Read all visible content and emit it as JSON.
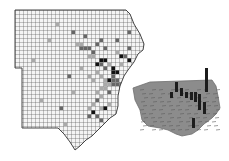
{
  "figure": {
    "width": 229,
    "height": 161,
    "background": "#ffffff",
    "grid_map": {
      "cell_size": 4,
      "origin": [
        15,
        10
      ],
      "outline": [
        [
          15,
          10
        ],
        [
          126,
          10
        ],
        [
          130,
          14
        ],
        [
          134,
          24
        ],
        [
          140,
          34
        ],
        [
          144,
          44
        ],
        [
          143,
          50
        ],
        [
          138,
          54
        ],
        [
          134,
          62
        ],
        [
          128,
          70
        ],
        [
          124,
          76
        ],
        [
          120,
          86
        ],
        [
          118,
          96
        ],
        [
          118,
          106
        ],
        [
          116,
          114
        ],
        [
          110,
          118
        ],
        [
          104,
          124
        ],
        [
          98,
          130
        ],
        [
          92,
          136
        ],
        [
          86,
          140
        ],
        [
          80,
          146
        ],
        [
          75,
          150
        ],
        [
          70,
          142
        ],
        [
          64,
          134
        ],
        [
          58,
          128
        ],
        [
          22,
          128
        ],
        [
          22,
          68
        ],
        [
          15,
          68
        ]
      ],
      "grid_color": "#5a5a5a",
      "fill_color": "#f4f4f4",
      "outline_color": "#444444",
      "dark_color": "#111111",
      "medium_color": "#666666",
      "light_color": "#a9a9a9",
      "cells_dark": [
        [
          21,
          12
        ],
        [
          22,
          12
        ],
        [
          20,
          13
        ],
        [
          24,
          15
        ],
        [
          23,
          17
        ],
        [
          25,
          15
        ],
        [
          27,
          19
        ],
        [
          26,
          20
        ],
        [
          27,
          20
        ],
        [
          28,
          20
        ],
        [
          28,
          21
        ],
        [
          27,
          21
        ],
        [
          29,
          22
        ],
        [
          29,
          19
        ],
        [
          26,
          19
        ],
        [
          24,
          14
        ],
        [
          26,
          23
        ],
        [
          19,
          25
        ],
        [
          22,
          24
        ],
        [
          31,
          15
        ],
        [
          18,
          33
        ],
        [
          28,
          12
        ],
        [
          26,
          11
        ]
      ],
      "cells_medium": [
        [
          14,
          5
        ],
        [
          17,
          6
        ],
        [
          20,
          8
        ],
        [
          21,
          7
        ],
        [
          25,
          7
        ],
        [
          28,
          5
        ],
        [
          22,
          9
        ],
        [
          16,
          9
        ],
        [
          17,
          9
        ],
        [
          18,
          9
        ],
        [
          19,
          10
        ],
        [
          21,
          13
        ],
        [
          22,
          14
        ],
        [
          24,
          16
        ],
        [
          25,
          17
        ],
        [
          25,
          18
        ],
        [
          24,
          18
        ],
        [
          26,
          18
        ],
        [
          23,
          20
        ],
        [
          20,
          22
        ],
        [
          18,
          26
        ],
        [
          20,
          26
        ],
        [
          21,
          27
        ],
        [
          24,
          17
        ],
        [
          27,
          11
        ],
        [
          13,
          16
        ],
        [
          11,
          24
        ],
        [
          28,
          9
        ]
      ],
      "cells_light": [
        [
          10,
          3
        ],
        [
          15,
          8
        ],
        [
          16,
          8
        ],
        [
          18,
          11
        ],
        [
          19,
          11
        ],
        [
          20,
          15
        ],
        [
          21,
          16
        ],
        [
          22,
          17
        ],
        [
          22,
          18
        ],
        [
          23,
          18
        ],
        [
          21,
          19
        ],
        [
          22,
          19
        ],
        [
          20,
          20
        ],
        [
          21,
          21
        ],
        [
          19,
          17
        ],
        [
          18,
          16
        ],
        [
          16,
          14
        ],
        [
          14,
          20
        ],
        [
          12,
          28
        ],
        [
          9,
          30
        ],
        [
          6,
          22
        ],
        [
          4,
          12
        ],
        [
          8,
          7
        ],
        [
          25,
          10
        ],
        [
          26,
          13
        ],
        [
          23,
          13
        ],
        [
          19,
          23
        ],
        [
          18,
          24
        ],
        [
          21,
          24
        ],
        [
          23,
          23
        ]
      ]
    },
    "perspective_view": {
      "outline": [
        [
          133,
          88
        ],
        [
          150,
          82
        ],
        [
          212,
          80
        ],
        [
          216,
          86
        ],
        [
          218,
          96
        ],
        [
          220,
          108
        ],
        [
          216,
          114
        ],
        [
          212,
          118
        ],
        [
          204,
          124
        ],
        [
          198,
          130
        ],
        [
          192,
          134
        ],
        [
          182,
          136
        ],
        [
          176,
          134
        ],
        [
          168,
          130
        ],
        [
          160,
          128
        ],
        [
          148,
          126
        ],
        [
          142,
          120
        ],
        [
          140,
          110
        ],
        [
          135,
          100
        ]
      ],
      "fill_color": "#8c8c8c",
      "edge_color": "#6e6e6e",
      "bars": [
        {
          "x": 175,
          "y": 90,
          "h": 8
        },
        {
          "x": 180,
          "y": 94,
          "h": 6
        },
        {
          "x": 185,
          "y": 96,
          "h": 4
        },
        {
          "x": 190,
          "y": 98,
          "h": 6
        },
        {
          "x": 194,
          "y": 100,
          "h": 8
        },
        {
          "x": 205,
          "y": 90,
          "h": 22
        },
        {
          "x": 198,
          "y": 108,
          "h": 14
        },
        {
          "x": 203,
          "y": 112,
          "h": 10
        },
        {
          "x": 192,
          "y": 126,
          "h": 8
        },
        {
          "x": 170,
          "y": 96,
          "h": 4
        }
      ],
      "bar_color": "#1c1c1c"
    }
  }
}
